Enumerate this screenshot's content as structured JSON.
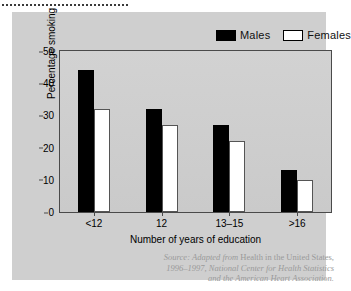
{
  "figure": {
    "panel_color": "#cfcfcf",
    "background_color": "#ffffff"
  },
  "legend": {
    "position": "top-right",
    "entries": [
      {
        "label": "Males",
        "swatch": "filled-black-square",
        "color": "#000000"
      },
      {
        "label": "Females",
        "swatch": "open-white-square",
        "color": "#ffffff"
      }
    ]
  },
  "source_note": {
    "line1_italic": "Source: Adapted from ",
    "line1_roman": "Health in the United States,",
    "line2": "1996–1997, National Center for Health Statistics",
    "line3": "and the American Heart Association."
  },
  "chart_data": {
    "type": "bar",
    "title": "",
    "xlabel": "Number of years of education",
    "ylabel": "Percentage smoking",
    "categories": [
      "<12",
      "12",
      "13–15",
      ">16"
    ],
    "series": [
      {
        "name": "Males",
        "color": "#000000",
        "values": [
          44,
          32,
          27,
          13
        ]
      },
      {
        "name": "Females",
        "color": "#ffffff",
        "values": [
          32,
          27,
          22,
          10
        ]
      }
    ],
    "ylim": [
      0,
      50
    ],
    "yticks": [
      0,
      10,
      20,
      30,
      40,
      50
    ],
    "grid": false,
    "legend_position": "top-right"
  }
}
